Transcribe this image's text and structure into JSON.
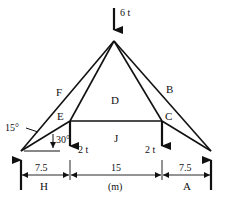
{
  "diagram": {
    "type": "roof truss with loads",
    "loads": {
      "apex": "6 t",
      "left_panel": "2 t",
      "right_panel": "2 t"
    },
    "region_labels": {
      "F": "F",
      "B": "B",
      "D": "D",
      "E": "E",
      "C": "C",
      "J": "J",
      "H": "H",
      "A": "A"
    },
    "angles": {
      "rafter": "15°",
      "tie": "30°"
    },
    "dimensions": {
      "left": "7.5",
      "middle": "15",
      "right": "7.5",
      "unit": "(m)"
    }
  }
}
